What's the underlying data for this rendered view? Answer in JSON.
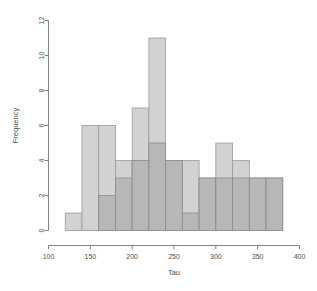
{
  "figure": {
    "faint_header_text": "",
    "background_color": "#ffffff"
  },
  "chart_data": {
    "type": "bar",
    "subtype": "histogram-overlay",
    "title": "",
    "xlabel": "Tau",
    "ylabel": "Frequency",
    "xlim": [
      100,
      400
    ],
    "ylim": [
      0,
      12
    ],
    "xticks": [
      100,
      150,
      200,
      250,
      300,
      350,
      400
    ],
    "yticks": [
      0,
      2,
      4,
      6,
      8,
      10,
      12
    ],
    "xtick_labels": [
      "100",
      "150",
      "200",
      "250",
      "300",
      "350",
      "400"
    ],
    "ytick_labels": [
      "0",
      "2",
      "4",
      "6",
      "8",
      "10",
      "12"
    ],
    "grid": false,
    "legend": null,
    "bin_width": 20,
    "series": [
      {
        "name": "series-light",
        "color": "#d2d2d2",
        "edge_color": "#9a9a9a",
        "bin_edges": [
          120,
          140,
          160,
          180,
          200,
          220,
          240,
          260,
          280,
          300,
          320,
          340,
          360,
          380
        ],
        "values": [
          1,
          6,
          6,
          4,
          7,
          11,
          4,
          4,
          3,
          5,
          4,
          3,
          3
        ]
      },
      {
        "name": "series-dark",
        "color": "#b4b4b4",
        "edge_color": "#8c8c8c",
        "bin_edges": [
          160,
          180,
          200,
          220,
          240,
          260,
          280,
          300,
          320,
          340,
          360,
          380
        ],
        "values": [
          2,
          3,
          4,
          5,
          4,
          1,
          3,
          3,
          3,
          3,
          3
        ]
      }
    ]
  }
}
